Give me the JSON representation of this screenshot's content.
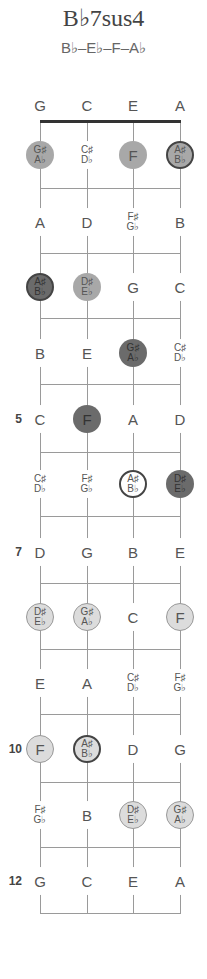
{
  "title": "B♭7sus4",
  "chord_notes": "B♭–E♭–F–A♭",
  "strings": [
    "G",
    "C",
    "E",
    "A"
  ],
  "string_x": [
    40,
    87,
    133,
    180
  ],
  "nut_y": 121,
  "fret_lines_y": [
    188,
    253,
    318,
    384,
    452,
    516,
    583,
    649,
    714,
    782,
    847,
    913
  ],
  "rows": [
    {
      "fret": 0,
      "y": 105,
      "label": "",
      "cells": [
        {
          "n": "G"
        },
        {
          "n": "C"
        },
        {
          "n": "E"
        },
        {
          "n": "A"
        }
      ]
    },
    {
      "fret": 1,
      "y": 155,
      "label": "",
      "cells": [
        {
          "n": "G♯",
          "n2": "A♭",
          "style": "mid"
        },
        {
          "n": "C♯",
          "n2": "D♭"
        },
        {
          "n": "F",
          "style": "mid"
        },
        {
          "n": "A♯",
          "n2": "B♭",
          "style": "mid ring"
        }
      ]
    },
    {
      "fret": 2,
      "y": 222,
      "label": "",
      "cells": [
        {
          "n": "A"
        },
        {
          "n": "D"
        },
        {
          "n": "F♯",
          "n2": "G♭"
        },
        {
          "n": "B"
        }
      ]
    },
    {
      "fret": 3,
      "y": 287,
      "label": "",
      "cells": [
        {
          "n": "A♯",
          "n2": "B♭",
          "style": "dark ring"
        },
        {
          "n": "D♯",
          "n2": "E♭",
          "style": "mid"
        },
        {
          "n": "G"
        },
        {
          "n": "C"
        }
      ]
    },
    {
      "fret": 4,
      "y": 353,
      "label": "",
      "cells": [
        {
          "n": "B"
        },
        {
          "n": "E"
        },
        {
          "n": "G♯",
          "n2": "A♭",
          "style": "dark"
        },
        {
          "n": "C♯",
          "n2": "D♭"
        }
      ]
    },
    {
      "fret": 5,
      "y": 419,
      "label": "5",
      "cells": [
        {
          "n": "C"
        },
        {
          "n": "F",
          "style": "dark"
        },
        {
          "n": "A"
        },
        {
          "n": "D"
        }
      ]
    },
    {
      "fret": 6,
      "y": 484,
      "label": "",
      "cells": [
        {
          "n": "C♯",
          "n2": "D♭"
        },
        {
          "n": "F♯",
          "n2": "G♭"
        },
        {
          "n": "A♯",
          "n2": "B♭",
          "style": "white ring"
        },
        {
          "n": "D♯",
          "n2": "E♭",
          "style": "dark"
        }
      ]
    },
    {
      "fret": 7,
      "y": 552,
      "label": "7",
      "cells": [
        {
          "n": "D"
        },
        {
          "n": "G"
        },
        {
          "n": "B"
        },
        {
          "n": "E"
        }
      ]
    },
    {
      "fret": 8,
      "y": 617,
      "label": "",
      "cells": [
        {
          "n": "D♯",
          "n2": "E♭",
          "style": "light"
        },
        {
          "n": "G♯",
          "n2": "A♭",
          "style": "light"
        },
        {
          "n": "C"
        },
        {
          "n": "F",
          "style": "light"
        }
      ]
    },
    {
      "fret": 9,
      "y": 683,
      "label": "",
      "cells": [
        {
          "n": "E"
        },
        {
          "n": "A"
        },
        {
          "n": "C♯",
          "n2": "D♭"
        },
        {
          "n": "F♯",
          "n2": "G♭"
        }
      ]
    },
    {
      "fret": 10,
      "y": 749,
      "label": "10",
      "cells": [
        {
          "n": "F",
          "style": "light"
        },
        {
          "n": "A♯",
          "n2": "B♭",
          "style": "light ring"
        },
        {
          "n": "D"
        },
        {
          "n": "G"
        }
      ]
    },
    {
      "fret": 11,
      "y": 815,
      "label": "",
      "cells": [
        {
          "n": "F♯",
          "n2": "G♭"
        },
        {
          "n": "B"
        },
        {
          "n": "D♯",
          "n2": "E♭",
          "style": "light"
        },
        {
          "n": "G♯",
          "n2": "A♭",
          "style": "light"
        }
      ]
    },
    {
      "fret": 12,
      "y": 881,
      "label": "12",
      "cells": [
        {
          "n": "G"
        },
        {
          "n": "C"
        },
        {
          "n": "E"
        },
        {
          "n": "A"
        }
      ]
    }
  ],
  "colors": {
    "root": "#6b6b6b",
    "mid": "#a8a8a8",
    "light": "#dcdcdc",
    "lines": "#9a9a9a",
    "nut": "#333333"
  }
}
